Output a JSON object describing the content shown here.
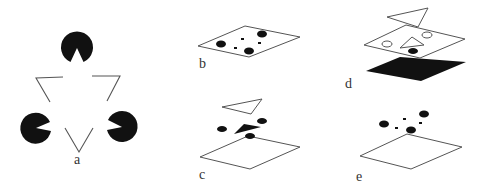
{
  "figure": {
    "panels": [
      {
        "id": "a",
        "label": "a",
        "description": "Kanizsa illusory triangle: three black pac-man inducers and outlined triangle fragments"
      },
      {
        "id": "b",
        "label": "b",
        "description": "Inducing fragments lying flat on a single plane"
      },
      {
        "id": "c",
        "label": "c",
        "description": "Layers: outline triangle above, black triangle with dots, white plane below"
      },
      {
        "id": "d",
        "label": "d",
        "description": "Layers: outline triangle above, white plane with holes and triangular window, black plane below"
      },
      {
        "id": "e",
        "label": "e",
        "description": "Fragments floating above a white plane"
      }
    ],
    "colors": {
      "ink": "#111111",
      "line": "#555555",
      "paper": "#ffffff",
      "label": "#333333"
    }
  }
}
